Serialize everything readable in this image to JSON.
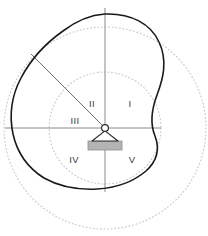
{
  "figure": {
    "title": "",
    "type": "engineering-cam-diagram",
    "width": 208,
    "height": 236,
    "background": "#ffffff"
  },
  "colors": {
    "outline": "#1a1a1a",
    "axis": "#8a8a8a",
    "dotted_circle": "#c9c9c9",
    "radius_line": "#6e6e6e",
    "pivot_stroke": "#2b2b2b",
    "pivot_fill": "#ffffff",
    "base_fill": "#b3b3b3",
    "base_stroke": "#8f8f8f",
    "label_text": "#3a3a3a"
  },
  "pivot": {
    "name": "pivot-support",
    "cx": 105,
    "cy": 128,
    "radius": 3.4,
    "triangle_half_width": 13,
    "triangle_height": 12,
    "base": {
      "x": 88,
      "y": 141,
      "width": 34,
      "height": 9
    }
  },
  "axes": {
    "horizontal": {
      "x1": 5,
      "y1": 128,
      "x2": 161,
      "y2": 128
    },
    "vertical": {
      "x1": 105,
      "y1": 8,
      "x2": 105,
      "y2": 192
    },
    "stroke_width": 1
  },
  "radius_line": {
    "name": "radius-ray",
    "x1": 105,
    "y1": 128,
    "x2": 31,
    "y2": 54,
    "stroke_width": 1
  },
  "dotted_circles": [
    {
      "name": "inner-dotted-circle",
      "cx": 105,
      "cy": 128,
      "r": 56
    },
    {
      "name": "outer-dotted-circle",
      "cx": 105,
      "cy": 128,
      "r": 101
    }
  ],
  "profile": {
    "name": "cam-profile-outline",
    "stroke_width": 1.6,
    "path": "M 105 14 C 131 13 151 24 159 42 C 168 61 163 79 157 95 C 151 111 150 124 155 136 C 160 149 157 161 146 171 C 133 182 115 188 97 189 C 78 190 60 187 44 178 C 28 168 17 152 13 134 C 9 115 12 95 21 78 C 31 59 46 43 63 31 C 76 21 90 15 105 14 Z"
  },
  "labels": [
    {
      "name": "quadrant-label-i",
      "text": "I",
      "x": 130,
      "y": 107
    },
    {
      "name": "quadrant-label-ii",
      "text": "II",
      "x": 92,
      "y": 107
    },
    {
      "name": "quadrant-label-iii",
      "text": "III",
      "x": 75,
      "y": 124
    },
    {
      "name": "quadrant-label-iv",
      "text": "IV",
      "x": 74,
      "y": 163
    },
    {
      "name": "quadrant-label-v",
      "text": "V",
      "x": 132,
      "y": 163
    }
  ]
}
